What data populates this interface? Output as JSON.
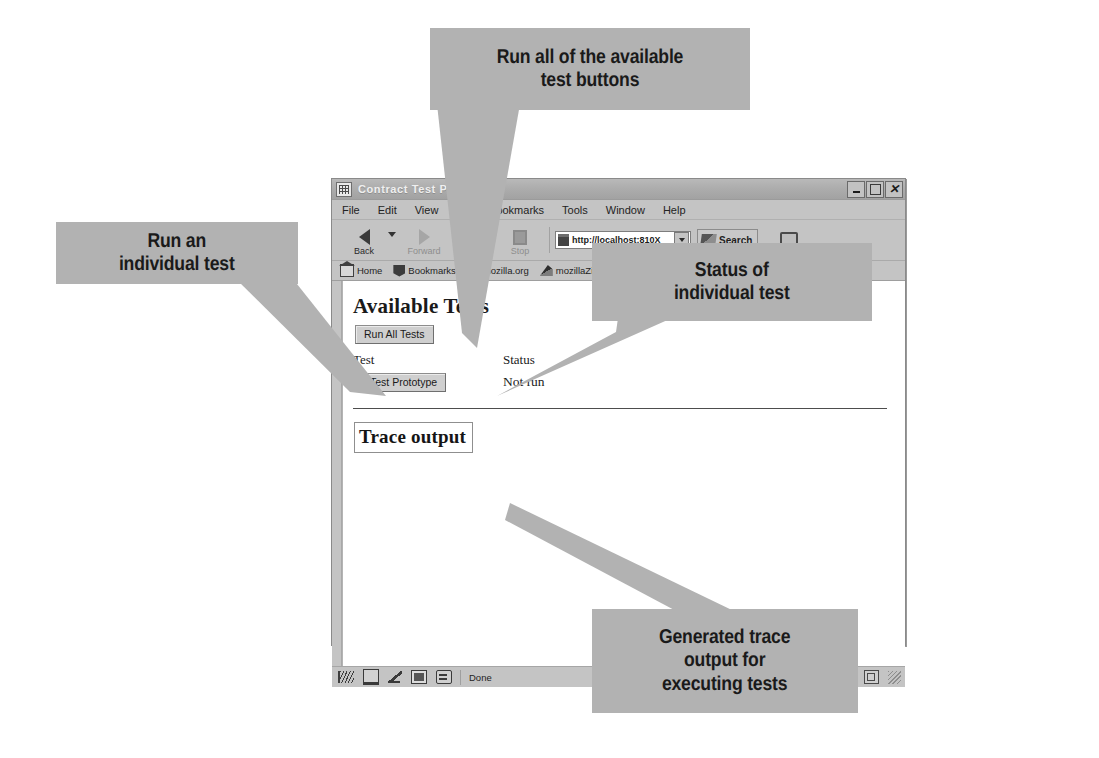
{
  "window": {
    "title": "Contract Test Page",
    "title_icon": "app-grid-icon",
    "controls": {
      "minimize": "minimize-button",
      "maximize": "maximize-button",
      "close": "close-button"
    }
  },
  "menubar": {
    "items": [
      "File",
      "Edit",
      "View",
      "Go",
      "Bookmarks",
      "Tools",
      "Window",
      "Help"
    ]
  },
  "toolbar": {
    "back_label": "Back",
    "forward_label": "Forward",
    "reload_label": "Reload",
    "stop_label": "Stop",
    "print_label": "Print",
    "search_label": "Search",
    "url_value": "http://localhost:810X",
    "url_placeholder": "Enter address"
  },
  "bookmarks_bar": {
    "items": [
      {
        "label": "Home",
        "icon": "home-icon"
      },
      {
        "label": "Bookmarks",
        "icon": "bookmark-icon"
      },
      {
        "label": "mozilla.org",
        "icon": "lizard-icon"
      },
      {
        "label": "mozillaZine",
        "icon": "lizard-icon"
      },
      {
        "label": "mozdev.org",
        "icon": "lizard-icon"
      }
    ]
  },
  "page": {
    "heading": "Available Tests",
    "run_all_label": "Run All Tests",
    "table": {
      "headers": [
        "Test",
        "Status"
      ],
      "rows": [
        {
          "test_button_label": "Test Prototype",
          "status": "Not run"
        }
      ]
    },
    "trace_output_label": "Trace output"
  },
  "statusbar": {
    "text": "Done",
    "icons": [
      "transfer-icon",
      "printer-icon",
      "pen-icon",
      "image-icon",
      "padlock-icon"
    ],
    "right_icons": [
      "security-icon",
      "resize-grip-icon"
    ]
  },
  "callouts": {
    "run_all": "Run all of the available\ntest buttons",
    "individual": "Run an\nindividual test",
    "status": "Status of\nindividual test",
    "trace": "Generated trace\noutput for\nexecuting tests"
  },
  "colors": {
    "callout_fill": "#b2b2b2",
    "chrome_gray": "#c4c4c4",
    "titlebar_gray": "#adadad",
    "page_white": "#ffffff",
    "text_dark": "#1a1a1a"
  }
}
